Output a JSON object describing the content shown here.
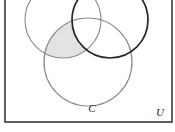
{
  "figure": {
    "kind": "venn-diagram",
    "set_count": 3,
    "background_color": "#ffffff"
  },
  "universe": {
    "label": "U",
    "label_x": 160,
    "label_y": 116,
    "rect": {
      "x": 5,
      "y": -6,
      "width": 167,
      "height": 128
    },
    "stroke_color": "#3a3a3a",
    "stroke_width": 1.6
  },
  "circles": [
    {
      "name": "left-circle",
      "label": "",
      "cx": 63,
      "cy": 20,
      "r": 38,
      "stroke_color": "#8a8a8a",
      "stroke_width": 1.1
    },
    {
      "name": "right-circle",
      "label": "",
      "cx": 110,
      "cy": 20,
      "r": 38,
      "stroke_color": "#262626",
      "stroke_width": 1.7
    },
    {
      "name": "bottom-circle",
      "label": "C",
      "label_x": 92,
      "label_y": 112,
      "cx": 88,
      "cy": 62,
      "r": 44,
      "stroke_color": "#8a8a8a",
      "stroke_width": 1.2
    }
  ],
  "shaded_region": {
    "name": "left-and-bottom-minus-right",
    "description": "region inside left circle and bottom circle but outside right circle",
    "fill_color": "#e3e3e3",
    "stroke_color": "#9a9a9a"
  }
}
